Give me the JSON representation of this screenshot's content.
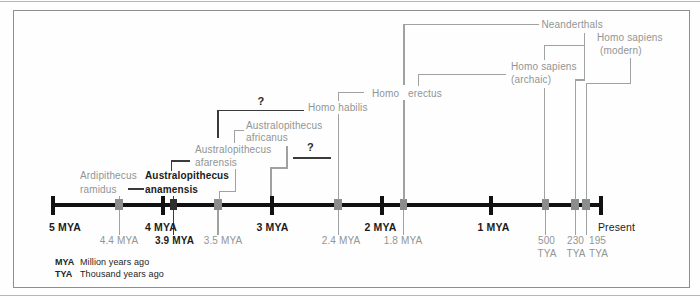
{
  "timeline": {
    "major_ticks": [
      "5 MYA",
      "4 MYA",
      "3 MYA",
      "2 MYA",
      "1 MYA",
      "Present"
    ],
    "fossil_dates_mya": [
      "4.4 MYA",
      "3.9 MYA",
      "3.5 MYA",
      "2.4 MYA",
      "1.8 MYA"
    ],
    "fossil_dates_tya": [
      {
        "value": "500",
        "unit": "TYA"
      },
      {
        "value": "230",
        "unit": "TYA"
      },
      {
        "value": "195",
        "unit": "TYA"
      }
    ]
  },
  "species": [
    {
      "line1": "Ardipithecus",
      "line2": "ramidus",
      "date": "4.4 MYA"
    },
    {
      "line1": "Australopithecus",
      "line2": "anamensis",
      "date": "3.9 MYA"
    },
    {
      "line1": "Australopithecus",
      "line2": "afarensis",
      "date": "3.5 MYA"
    },
    {
      "line1": "Australopithecus",
      "line2": "africanus",
      "date": "3 MYA"
    },
    {
      "line1": "Homo habilis",
      "date": "2.4 MYA"
    },
    {
      "line1": "Homo",
      "line2": "erectus",
      "date": "1.8 MYA"
    },
    {
      "line1": "Homo sapiens",
      "line2": "(archaic)",
      "date": "500 TYA"
    },
    {
      "line1": "Neanderthals",
      "date": "230 TYA"
    },
    {
      "line1": "Homo sapiens",
      "line2": "(modern)",
      "date": "195 TYA"
    }
  ],
  "uncertainty_mark": "?",
  "legend": [
    {
      "abbr": "MYA",
      "definition": "Million years ago"
    },
    {
      "abbr": "TYA",
      "definition": "Thousand years ago"
    }
  ],
  "colors": {
    "species_gray": "#919594",
    "connector_gray": "#a0a2a1",
    "text_black": "#1c1c1c",
    "marker_gray": "#8b8d8c",
    "marker_dark": "#303030",
    "timeline_black": "#111111",
    "frame_gray": "#8d8f8e"
  }
}
